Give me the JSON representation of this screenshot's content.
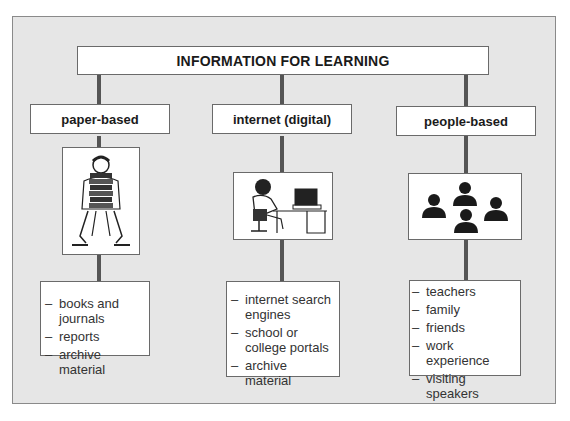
{
  "diagram": {
    "title": "INFORMATION FOR LEARNING",
    "categories": [
      {
        "label": "paper-based",
        "icon": "person-carrying-books-icon",
        "items": [
          "books and journals",
          "reports",
          "archive material"
        ]
      },
      {
        "label": "internet (digital)",
        "icon": "person-at-computer-icon",
        "items": [
          "internet search engines",
          "school or college portals",
          "archive material"
        ]
      },
      {
        "label": "people-based",
        "icon": "group-of-people-icon",
        "items": [
          "teachers",
          "family",
          "friends",
          "work experience",
          "visiting speakers"
        ]
      }
    ],
    "colors": {
      "background": "#e6e6e6",
      "box": "#ffffff",
      "connector": "#555555"
    }
  }
}
